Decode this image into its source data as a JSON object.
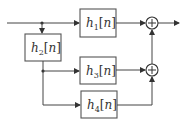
{
  "diagram": {
    "type": "block-diagram",
    "blocks": [
      {
        "id": "h1",
        "symbol": "h",
        "subscript": "1",
        "arg": "n",
        "open": "[",
        "close": "]"
      },
      {
        "id": "h2",
        "symbol": "h",
        "subscript": "2",
        "arg": "n",
        "open": "[",
        "close": "]"
      },
      {
        "id": "h3",
        "symbol": "h",
        "subscript": "3",
        "arg": "n",
        "open": "[",
        "close": "]"
      },
      {
        "id": "h4",
        "symbol": "h",
        "subscript": "4",
        "arg": "n",
        "open": "[",
        "close": "]"
      }
    ],
    "summers": [
      {
        "id": "sum1",
        "symbol": "+"
      },
      {
        "id": "sum2",
        "symbol": "+"
      }
    ],
    "connections": [
      {
        "from": "input",
        "to": "h1"
      },
      {
        "from": "input",
        "to": "h2"
      },
      {
        "from": "h2",
        "to": "h3"
      },
      {
        "from": "h2",
        "to": "h4"
      },
      {
        "from": "h1",
        "to": "sum1"
      },
      {
        "from": "h3",
        "to": "sum2"
      },
      {
        "from": "h4",
        "to": "sum2"
      },
      {
        "from": "sum2",
        "to": "sum1"
      },
      {
        "from": "sum1",
        "to": "output"
      }
    ],
    "colors": {
      "line": "#444444",
      "box": "#555555",
      "text": "#333333",
      "background": "#ffffff"
    }
  }
}
